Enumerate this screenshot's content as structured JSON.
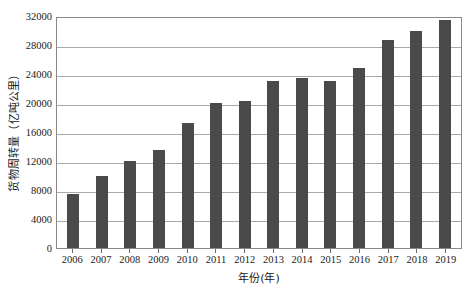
{
  "chart_data": {
    "type": "bar",
    "title": "",
    "xlabel": "年份(年)",
    "ylabel": "货物周转量（亿吨公里）",
    "categories": [
      "2006",
      "2007",
      "2008",
      "2009",
      "2010",
      "2011",
      "2012",
      "2013",
      "2014",
      "2015",
      "2016",
      "2017",
      "2018",
      "2019"
    ],
    "values": [
      7500,
      9900,
      12000,
      13500,
      17200,
      20000,
      20300,
      23000,
      23400,
      23000,
      24800,
      28700,
      30000,
      31400
    ],
    "ylim": [
      0,
      32000
    ],
    "ytick_labels": [
      "0",
      "4000",
      "8000",
      "12000",
      "16000",
      "20000",
      "24000",
      "28000",
      "32000"
    ],
    "ytick_values": [
      0,
      4000,
      8000,
      12000,
      16000,
      20000,
      24000,
      28000,
      32000
    ],
    "grid": true,
    "legend": "none",
    "bar_color": "#4a4a4a",
    "grid_color": "#a9a9a9",
    "axis_color": "#8a8a8a"
  }
}
